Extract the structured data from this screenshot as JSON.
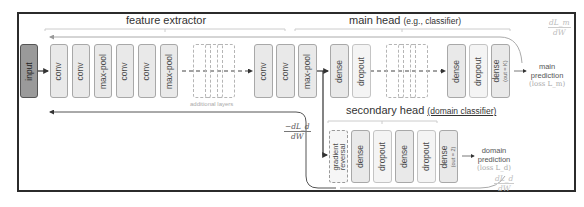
{
  "sections": {
    "feature_extractor": {
      "title": "feature extractor"
    },
    "main_head": {
      "title": "main head",
      "subtitle": "(e.g., classifier)"
    },
    "secondary_head": {
      "title": "secondary head",
      "subtitle": "(domain classifier)"
    }
  },
  "input": {
    "label": "input"
  },
  "feature_layers": [
    {
      "label": "conv"
    },
    {
      "label": "conv"
    },
    {
      "label": "max-pool"
    },
    {
      "label": "conv"
    },
    {
      "label": "conv"
    },
    {
      "label": "max-pool"
    },
    {
      "label": "conv"
    },
    {
      "label": "conv"
    },
    {
      "label": "max-pool"
    }
  ],
  "additional_layers_caption": "additional layers",
  "main_layers": [
    {
      "label": "dense"
    },
    {
      "label": "dropout"
    },
    {
      "label": "dense"
    },
    {
      "label": "dropout"
    },
    {
      "label": "dense",
      "note": "(out = K)"
    }
  ],
  "secondary_layers": [
    {
      "label": "gradient reversal"
    },
    {
      "label": "dense"
    },
    {
      "label": "dropout"
    },
    {
      "label": "dense"
    },
    {
      "label": "dropout"
    },
    {
      "label": "dense",
      "note": "(out = 2)"
    }
  ],
  "outputs": {
    "main": {
      "line1": "main",
      "line2": "prediction",
      "loss": "(loss L_m)"
    },
    "domain": {
      "line1": "domain",
      "line2": "prediction",
      "loss": "(loss L_d)"
    }
  },
  "gradients": {
    "main": {
      "num": "dL_m",
      "den": "dW"
    },
    "domain_reversed": {
      "num": "−dL_d",
      "den": "dW"
    },
    "domain": {
      "num": "dL_d",
      "den": "dW"
    }
  }
}
